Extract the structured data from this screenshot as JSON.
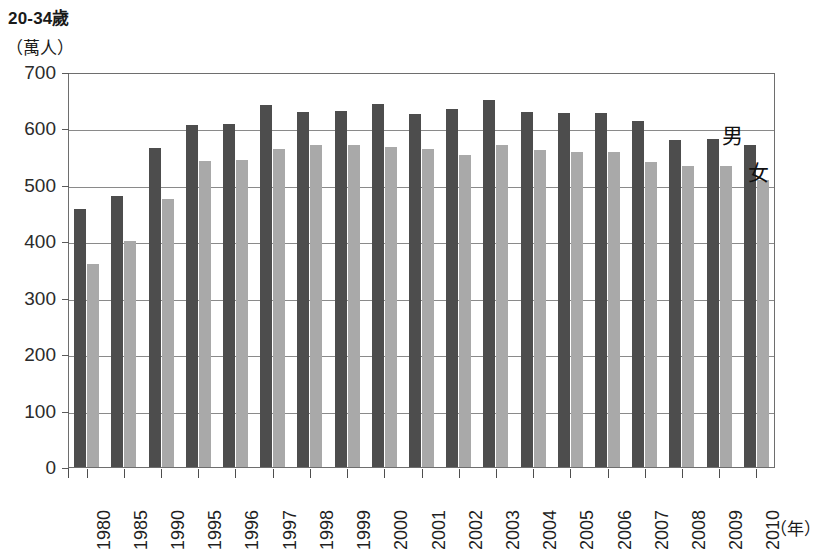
{
  "chart_data": {
    "type": "bar",
    "title": "20-34歲",
    "unit_label": "（萬人）",
    "xlabel": "（年）",
    "ylabel": "",
    "ylim": [
      0,
      700
    ],
    "ytick_step": 100,
    "yticks": [
      "0",
      "100",
      "200",
      "300",
      "400",
      "500",
      "600",
      "700"
    ],
    "grid": true,
    "legend_position": "inline-right-annotation",
    "categories": [
      "1980",
      "1985",
      "1990",
      "1995",
      "1996",
      "1997",
      "1998",
      "1999",
      "2000",
      "2001",
      "2002",
      "2003",
      "2004",
      "2005",
      "2006",
      "2007",
      "2008",
      "2009",
      "2010"
    ],
    "series": [
      {
        "name": "男",
        "color": "#4d4d4d",
        "values": [
          458,
          481,
          566,
          606,
          608,
          642,
          630,
          631,
          643,
          626,
          634,
          651,
          630,
          627,
          628,
          613,
          580,
          581,
          570
        ]
      },
      {
        "name": "女",
        "color": "#a9a9a9",
        "values": [
          360,
          401,
          475,
          543,
          544,
          564,
          570,
          570,
          567,
          564,
          553,
          571,
          562,
          558,
          558,
          541,
          534,
          534,
          508
        ]
      }
    ],
    "annotations": [
      {
        "text": "男",
        "series": "male"
      },
      {
        "text": "女",
        "series": "female"
      }
    ]
  }
}
